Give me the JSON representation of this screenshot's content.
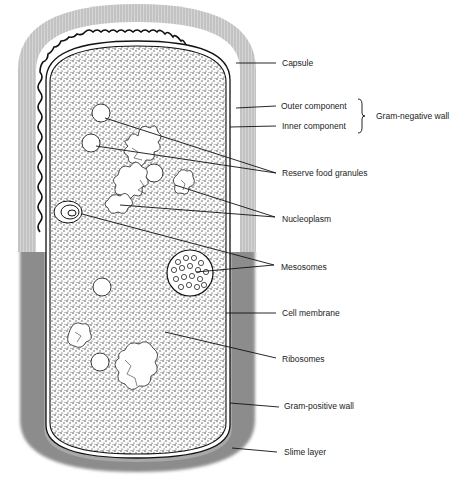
{
  "figure": {
    "colors": {
      "background": "#ffffff",
      "slime_layer": "#8a8a8a",
      "capsule_fringe": "#b8b8b8",
      "cytoplasm_stipple": "#333333",
      "outline": "#111111",
      "label_text": "#222222"
    }
  },
  "labels": {
    "capsule": "Capsule",
    "outer_component": "Outer component",
    "inner_component": "Inner component",
    "gram_negative_wall": "Gram-negative wall",
    "reserve_food_granules": "Reserve food granules",
    "nucleoplasm": "Nucleoplasm",
    "mesosomes": "Mesosomes",
    "cell_membrane": "Cell membrane",
    "ribosomes": "Ribosomes",
    "gram_positive_wall": "Gram-positive wall",
    "slime_layer": "Slime layer"
  }
}
